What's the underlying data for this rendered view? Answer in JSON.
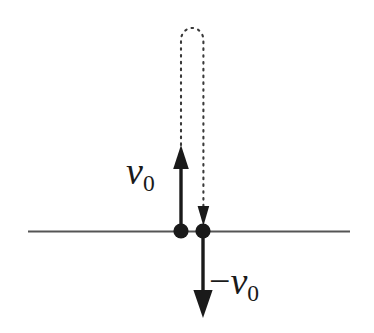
{
  "figure": {
    "background_color": "#ffffff",
    "stroke_color": "#1a1a1a",
    "line_color": "#555555",
    "width": 374,
    "height": 333
  },
  "labels": {
    "initial_velocity": {
      "symbol": "v",
      "subscript": "0",
      "text": "v0",
      "x": 126,
      "y": 152
    },
    "return_velocity": {
      "minus": "−",
      "symbol": "v",
      "subscript": "0",
      "text": "−v0",
      "x": 209,
      "y": 262
    }
  },
  "elements": {
    "ground_line": {
      "name": "horizontal-reference-line",
      "x1": 28,
      "y1": 231,
      "x2": 350,
      "y2": 231,
      "stroke_width": 2.2,
      "color": "#555555"
    },
    "launch_point": {
      "name": "left-dot",
      "cx": 181,
      "cy": 231,
      "r": 7.5,
      "color": "#1a1a1a"
    },
    "return_point": {
      "name": "right-dot",
      "cx": 203,
      "cy": 231,
      "r": 7.5,
      "color": "#1a1a1a"
    },
    "up_arrow": {
      "name": "upward-velocity-arrow",
      "x": 181,
      "y_tail": 231,
      "y_tip": 145,
      "stroke_width": 3.2,
      "head_width": 16,
      "head_length": 22,
      "color": "#1a1a1a"
    },
    "down_arrow": {
      "name": "downward-velocity-arrow",
      "x": 203,
      "y_tail": 231,
      "y_tip": 318,
      "stroke_width": 3.2,
      "head_width": 20,
      "head_length": 26,
      "color": "#1a1a1a"
    },
    "dotted_trajectory": {
      "name": "dotted-trajectory-path",
      "left_x": 181,
      "right_x": 203,
      "top_y": 28,
      "start_y": 145,
      "end_y": 213,
      "dash": "1.6 5.2",
      "stroke_width": 2.1,
      "head_width": 11,
      "head_length": 13,
      "color": "#3a3a3a"
    }
  }
}
